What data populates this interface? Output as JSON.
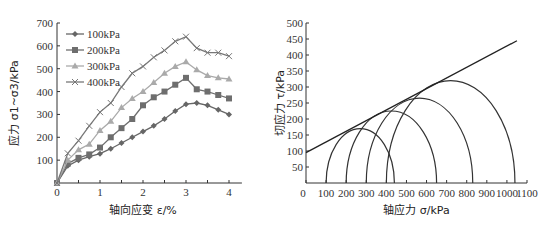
{
  "chart_data": [
    {
      "type": "line",
      "title": "",
      "xlabel": "轴向应变 ε/%",
      "ylabel": "应力 σ1~σ3/kPa",
      "xlim": [
        0,
        4.3
      ],
      "ylim": [
        0,
        700
      ],
      "xticks": [
        "0",
        "1",
        "2",
        "3",
        "4"
      ],
      "yticks": [
        "0",
        "100",
        "200",
        "300",
        "400",
        "500",
        "600",
        "700"
      ],
      "grid": false,
      "legend_position": "upper-left",
      "x": [
        0,
        0.25,
        0.5,
        0.75,
        1.0,
        1.25,
        1.5,
        1.75,
        2.0,
        2.25,
        2.5,
        2.75,
        3.0,
        3.25,
        3.5,
        3.75,
        4.0
      ],
      "series": [
        {
          "name": "100kPa",
          "marker": "diamond",
          "color": "#666666",
          "values": [
            0,
            75,
            100,
            115,
            128,
            150,
            175,
            200,
            225,
            250,
            280,
            315,
            345,
            350,
            340,
            320,
            300
          ]
        },
        {
          "name": "200kPa",
          "marker": "square",
          "color": "#6e6e6e",
          "values": [
            0,
            85,
            110,
            125,
            155,
            200,
            240,
            280,
            340,
            375,
            400,
            430,
            460,
            410,
            400,
            385,
            370
          ]
        },
        {
          "name": "300kPa",
          "marker": "triangle",
          "color": "#aaaaaa",
          "values": [
            0,
            100,
            145,
            170,
            230,
            270,
            330,
            370,
            400,
            440,
            480,
            510,
            530,
            495,
            470,
            460,
            455
          ]
        },
        {
          "name": "400kPa",
          "marker": "cross",
          "color": "#777777",
          "values": [
            0,
            130,
            185,
            250,
            310,
            350,
            420,
            480,
            510,
            550,
            580,
            620,
            640,
            590,
            570,
            570,
            555
          ]
        }
      ]
    },
    {
      "type": "line",
      "title": "",
      "subtype": "mohr-circles",
      "xlabel": "轴应力 σ/kPa",
      "ylabel": "切应力 τ/kPa",
      "xlim": [
        0,
        1100
      ],
      "ylim": [
        0,
        500
      ],
      "xticks": [
        "0",
        "100",
        "200",
        "300",
        "400",
        "500",
        "600",
        "700",
        "800",
        "900",
        "1000",
        "1100"
      ],
      "yticks": [
        "50",
        "100",
        "150",
        "200",
        "250",
        "300",
        "350",
        "400",
        "450",
        "500"
      ],
      "grid": false,
      "circles": [
        {
          "sigma3": 100,
          "sigma1": 440,
          "center": 270,
          "radius": 170
        },
        {
          "sigma3": 200,
          "sigma1": 650,
          "center": 425,
          "radius": 225
        },
        {
          "sigma3": 300,
          "sigma1": 830,
          "center": 565,
          "radius": 265
        },
        {
          "sigma3": 400,
          "sigma1": 1040,
          "center": 720,
          "radius": 320
        }
      ],
      "envelope": {
        "intercept": 95,
        "slope": 0.333,
        "x_end": 1050
      }
    }
  ]
}
